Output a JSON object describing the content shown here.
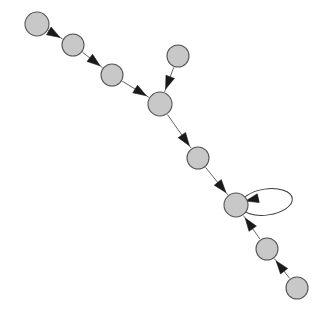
{
  "diagram": {
    "type": "directed-graph",
    "canvas": {
      "width": 326,
      "height": 321,
      "background": "#ffffff"
    },
    "style": {
      "node_fill": "#c8c8c8",
      "node_stroke": "#555555",
      "node_stroke_width": 1.1,
      "edge_stroke": "#666666",
      "edge_stroke_width": 1.0,
      "arrow_fill": "#1a1a1a",
      "arrow_length": 13,
      "arrow_width": 9,
      "loop_stroke": "#3a3a3a"
    },
    "nodes": [
      {
        "id": "n1",
        "label": "",
        "cx": 37,
        "cy": 24,
        "r": 12
      },
      {
        "id": "n2",
        "label": "",
        "cx": 73,
        "cy": 45,
        "r": 11
      },
      {
        "id": "n3",
        "label": "",
        "cx": 112,
        "cy": 75,
        "r": 11
      },
      {
        "id": "n4",
        "label": "",
        "cx": 178,
        "cy": 56,
        "r": 11
      },
      {
        "id": "n5",
        "label": "",
        "cx": 160,
        "cy": 104,
        "r": 12
      },
      {
        "id": "n6",
        "label": "",
        "cx": 198,
        "cy": 158,
        "r": 11
      },
      {
        "id": "n7",
        "label": "",
        "cx": 236,
        "cy": 205,
        "r": 12
      },
      {
        "id": "n8",
        "label": "",
        "cx": 267,
        "cy": 249,
        "r": 11
      },
      {
        "id": "n9",
        "label": "",
        "cx": 297,
        "cy": 288,
        "r": 11
      }
    ],
    "edges": [
      {
        "id": "e1",
        "from": "n1",
        "to": "n2",
        "directed": true,
        "kind": "straight"
      },
      {
        "id": "e2",
        "from": "n2",
        "to": "n3",
        "directed": true,
        "kind": "straight"
      },
      {
        "id": "e3",
        "from": "n3",
        "to": "n5",
        "directed": true,
        "kind": "straight"
      },
      {
        "id": "e4",
        "from": "n4",
        "to": "n5",
        "directed": true,
        "kind": "straight"
      },
      {
        "id": "e5",
        "from": "n5",
        "to": "n6",
        "directed": true,
        "kind": "straight"
      },
      {
        "id": "e6",
        "from": "n6",
        "to": "n7",
        "directed": true,
        "kind": "straight"
      },
      {
        "id": "e7",
        "from": "n9",
        "to": "n8",
        "directed": true,
        "kind": "straight"
      },
      {
        "id": "e8",
        "from": "n8",
        "to": "n7",
        "directed": true,
        "kind": "straight"
      },
      {
        "id": "e9",
        "from": "n7",
        "to": "n7",
        "directed": true,
        "kind": "self-loop",
        "loop": {
          "rx": 26,
          "ry": 13,
          "angle_deg": -8,
          "side": "right"
        }
      }
    ]
  }
}
